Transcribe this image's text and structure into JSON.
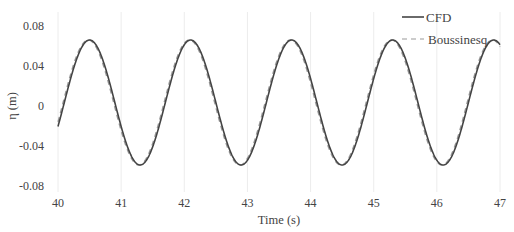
{
  "chart_data": {
    "type": "line",
    "title": "",
    "xlabel": "Time (s)",
    "ylabel": "η (m)",
    "xlim": [
      40,
      47
    ],
    "ylim": [
      -0.08,
      0.08
    ],
    "xticks": [
      "40",
      "41",
      "42",
      "43",
      "44",
      "45",
      "46",
      "47"
    ],
    "yticks": [
      "0.08",
      "0.04",
      "0",
      "-0.04",
      "-0.08"
    ],
    "grid": {
      "vertical": true,
      "horizontal": false
    },
    "legend_position": "upper right",
    "wave": {
      "period": 1.6,
      "crest": 0.066,
      "trough": -0.059,
      "first_crest_time": 40.5
    },
    "series": [
      {
        "name": "CFD",
        "style": "solid",
        "color": "#444444",
        "x": [
          40.0,
          40.1,
          40.2,
          40.3,
          40.4,
          40.5,
          40.6,
          40.7,
          40.8,
          40.9,
          41.0,
          41.1,
          41.2,
          41.3,
          41.4,
          41.5,
          41.6,
          41.7,
          41.8,
          41.9,
          42.0,
          42.1,
          42.2,
          42.3,
          42.4,
          42.5,
          42.6,
          42.7,
          42.8,
          42.9,
          43.0,
          43.1,
          43.2,
          43.3,
          43.4,
          43.5,
          43.6,
          43.7,
          43.8,
          43.9,
          44.0,
          44.1,
          44.2,
          44.3,
          44.4,
          44.5,
          44.6,
          44.7,
          44.8,
          44.9,
          45.0,
          45.1,
          45.2,
          45.3,
          45.4,
          45.5,
          45.6,
          45.7,
          45.8,
          45.9,
          46.0,
          46.1,
          46.2,
          46.3,
          46.4,
          46.5,
          46.6,
          46.7,
          46.8,
          46.9,
          47.0
        ],
        "values": [
          -0.034,
          -0.004,
          0.025,
          0.048,
          0.062,
          0.066,
          0.06,
          0.044,
          0.021,
          -0.006,
          -0.031,
          -0.05,
          -0.058,
          -0.059,
          -0.051,
          -0.034,
          -0.009,
          0.019,
          0.043,
          0.059,
          0.066,
          0.063,
          0.05,
          0.029,
          0.003,
          -0.024,
          -0.045,
          -0.057,
          -0.059,
          -0.055,
          -0.039,
          -0.016,
          0.012,
          0.038,
          0.056,
          0.065,
          0.065,
          0.054,
          0.035,
          0.01,
          -0.017,
          -0.04,
          -0.055,
          -0.059,
          -0.057,
          -0.044,
          -0.022,
          0.005,
          0.032,
          0.053,
          0.064,
          0.066,
          0.058,
          0.041,
          0.017,
          -0.01,
          -0.034,
          -0.052,
          -0.059,
          -0.058,
          -0.048,
          -0.028,
          -0.002,
          0.026,
          0.049,
          0.063,
          0.066,
          0.061,
          0.047,
          0.055,
          0.067
        ]
      },
      {
        "name": "Boussinesq",
        "style": "dashed",
        "color": "#999999",
        "x": [
          40.0,
          40.1,
          40.2,
          40.3,
          40.4,
          40.5,
          40.6,
          40.7,
          40.8,
          40.9,
          41.0,
          41.1,
          41.2,
          41.3,
          41.4,
          41.5,
          41.6,
          41.7,
          41.8,
          41.9,
          42.0,
          42.1,
          42.2,
          42.3,
          42.4,
          42.5,
          42.6,
          42.7,
          42.8,
          42.9,
          43.0,
          43.1,
          43.2,
          43.3,
          43.4,
          43.5,
          43.6,
          43.7,
          43.8,
          43.9,
          44.0,
          44.1,
          44.2,
          44.3,
          44.4,
          44.5,
          44.6,
          44.7,
          44.8,
          44.9,
          45.0,
          45.1,
          45.2,
          45.3,
          45.4,
          45.5,
          45.6,
          45.7,
          45.8,
          45.9,
          46.0,
          46.1,
          46.2,
          46.3,
          46.4,
          46.5,
          46.6,
          46.7,
          46.8,
          46.9,
          47.0
        ],
        "values": [
          -0.03,
          0.0,
          0.028,
          0.05,
          0.062,
          0.065,
          0.058,
          0.042,
          0.019,
          -0.008,
          -0.033,
          -0.051,
          -0.059,
          -0.06,
          -0.05,
          -0.032,
          -0.006,
          0.022,
          0.045,
          0.06,
          0.065,
          0.062,
          0.048,
          0.027,
          0.001,
          -0.026,
          -0.047,
          -0.058,
          -0.06,
          -0.054,
          -0.037,
          -0.013,
          0.015,
          0.04,
          0.057,
          0.065,
          0.064,
          0.052,
          0.033,
          0.008,
          -0.019,
          -0.042,
          -0.056,
          -0.06,
          -0.056,
          -0.042,
          -0.02,
          0.008,
          0.035,
          0.054,
          0.064,
          0.065,
          0.056,
          0.039,
          0.015,
          -0.012,
          -0.036,
          -0.053,
          -0.06,
          -0.057,
          -0.046,
          -0.025,
          0.001,
          0.029,
          0.051,
          0.063,
          0.065,
          0.059,
          0.045,
          0.054,
          0.066
        ]
      }
    ]
  }
}
